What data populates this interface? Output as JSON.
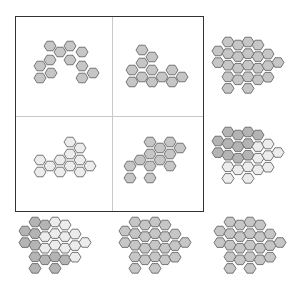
{
  "colors": {
    "dark": "#b4b4b4",
    "medium": "#c6c6c6",
    "light": "#ececec",
    "stroke": "#6a6a6a",
    "frame": "#333333",
    "divider": "#c8c8c8"
  },
  "hex": {
    "radius": 6,
    "col_step": 10,
    "row_step": 11.6
  },
  "panels": [
    {
      "id": "top-left",
      "in_grid": true,
      "fill": "medium",
      "cells": [
        [
          50,
          46
        ],
        [
          70,
          46
        ],
        [
          60,
          52
        ],
        [
          82,
          52
        ],
        [
          50,
          60
        ],
        [
          70,
          60
        ],
        [
          40,
          66
        ],
        [
          82,
          66
        ],
        [
          51,
          73
        ],
        [
          93,
          73
        ],
        [
          40,
          78
        ],
        [
          82,
          78
        ]
      ]
    },
    {
      "id": "top-center",
      "in_grid": true,
      "fill": "medium",
      "cells": [
        [
          142,
          50
        ],
        [
          152,
          57
        ],
        [
          142,
          63
        ],
        [
          132,
          70
        ],
        [
          152,
          70
        ],
        [
          172,
          70
        ],
        [
          142,
          77
        ],
        [
          162,
          77
        ],
        [
          182,
          77
        ],
        [
          132,
          82
        ],
        [
          152,
          82
        ],
        [
          172,
          82
        ]
      ]
    },
    {
      "id": "middle-left",
      "in_grid": true,
      "fill": "light",
      "cells": [
        [
          70,
          142
        ],
        [
          80,
          148
        ],
        [
          70,
          154
        ],
        [
          40,
          160
        ],
        [
          60,
          160
        ],
        [
          80,
          160
        ],
        [
          50,
          166
        ],
        [
          70,
          166
        ],
        [
          90,
          166
        ],
        [
          40,
          172
        ],
        [
          60,
          172
        ],
        [
          80,
          172
        ]
      ]
    },
    {
      "id": "middle-center",
      "in_grid": true,
      "fill": "medium",
      "cells": [
        [
          150,
          142
        ],
        [
          170,
          142
        ],
        [
          160,
          148
        ],
        [
          180,
          148
        ],
        [
          150,
          154
        ],
        [
          170,
          154
        ],
        [
          140,
          160
        ],
        [
          160,
          160
        ],
        [
          130,
          166
        ],
        [
          150,
          166
        ],
        [
          170,
          166
        ],
        [
          130,
          178
        ],
        [
          150,
          178
        ]
      ]
    }
  ],
  "options": [
    {
      "id": "option-top-right",
      "origin": [
        218,
        42
      ],
      "columns": [
        {
          "dy": 18,
          "cells": [
            "medium",
            "medium"
          ]
        },
        {
          "dy": 0,
          "cells": [
            "medium",
            "medium",
            "medium",
            "medium",
            "medium"
          ]
        },
        {
          "dy": 6,
          "cells": [
            "medium",
            "medium",
            "medium",
            "medium"
          ]
        },
        {
          "dy": 0,
          "cells": [
            "medium",
            "medium",
            "medium",
            "medium",
            "medium"
          ]
        },
        {
          "dy": 6,
          "cells": [
            "medium",
            "medium",
            "medium",
            "medium"
          ]
        },
        {
          "dy": 24,
          "cells": [
            "medium",
            "medium",
            "medium"
          ]
        },
        {
          "dy": 41,
          "cells": [
            "medium"
          ]
        }
      ]
    },
    {
      "id": "option-middle-right",
      "origin": [
        218,
        132
      ],
      "columns": [
        {
          "dy": 18,
          "cells": [
            "dark",
            "dark"
          ]
        },
        {
          "dy": 0,
          "cells": [
            "dark",
            "dark",
            "dark",
            "light",
            "light"
          ]
        },
        {
          "dy": 6,
          "cells": [
            "dark",
            "dark",
            "dark",
            "light"
          ]
        },
        {
          "dy": 0,
          "cells": [
            "dark",
            "dark",
            "dark",
            "light",
            "light"
          ]
        },
        {
          "dy": 6,
          "cells": [
            "dark",
            "light",
            "light",
            "light"
          ]
        },
        {
          "dy": 24,
          "cells": [
            "light",
            "light",
            "light"
          ]
        },
        {
          "dy": 41,
          "cells": [
            "light"
          ]
        }
      ]
    },
    {
      "id": "option-bottom-left",
      "origin": [
        25,
        222
      ],
      "columns": [
        {
          "dy": 18,
          "cells": [
            "dark",
            "dark"
          ]
        },
        {
          "dy": 0,
          "cells": [
            "dark",
            "dark",
            "dark",
            "dark",
            "dark"
          ]
        },
        {
          "dy": 6,
          "cells": [
            "dark",
            "light",
            "light",
            "dark"
          ]
        },
        {
          "dy": 0,
          "cells": [
            "light",
            "light",
            "light",
            "dark",
            "dark"
          ]
        },
        {
          "dy": 6,
          "cells": [
            "light",
            "light",
            "light",
            "dark"
          ]
        },
        {
          "dy": 24,
          "cells": [
            "light",
            "light",
            "light"
          ]
        },
        {
          "dy": 41,
          "cells": [
            "light"
          ]
        }
      ]
    },
    {
      "id": "option-bottom-center",
      "origin": [
        125,
        222
      ],
      "columns": [
        {
          "dy": 18,
          "cells": [
            "medium",
            "medium"
          ]
        },
        {
          "dy": 0,
          "cells": [
            "medium",
            "medium",
            "medium",
            "medium",
            "medium"
          ]
        },
        {
          "dy": 6,
          "cells": [
            "medium",
            "medium",
            "medium",
            "medium"
          ]
        },
        {
          "dy": 0,
          "cells": [
            "medium",
            "medium",
            "medium",
            "medium",
            "medium"
          ]
        },
        {
          "dy": 6,
          "cells": [
            "medium",
            "medium",
            "medium",
            "medium"
          ]
        },
        {
          "dy": 24,
          "cells": [
            "medium",
            "medium",
            "medium"
          ]
        },
        {
          "dy": 41,
          "cells": [
            "medium"
          ]
        }
      ]
    },
    {
      "id": "option-bottom-right",
      "origin": [
        220,
        222
      ],
      "columns": [
        {
          "dy": 18,
          "cells": [
            "medium",
            "medium"
          ]
        },
        {
          "dy": 0,
          "cells": [
            "medium",
            "medium",
            "medium",
            "medium",
            "medium"
          ]
        },
        {
          "dy": 6,
          "cells": [
            "medium",
            "medium",
            "medium",
            "medium"
          ]
        },
        {
          "dy": 0,
          "cells": [
            "medium",
            "medium",
            "medium",
            "medium",
            "medium"
          ]
        },
        {
          "dy": 6,
          "cells": [
            "medium",
            "medium",
            "medium",
            "medium"
          ]
        },
        {
          "dy": 24,
          "cells": [
            "medium",
            "medium",
            "medium"
          ]
        },
        {
          "dy": 41,
          "cells": [
            "medium"
          ]
        }
      ]
    }
  ]
}
